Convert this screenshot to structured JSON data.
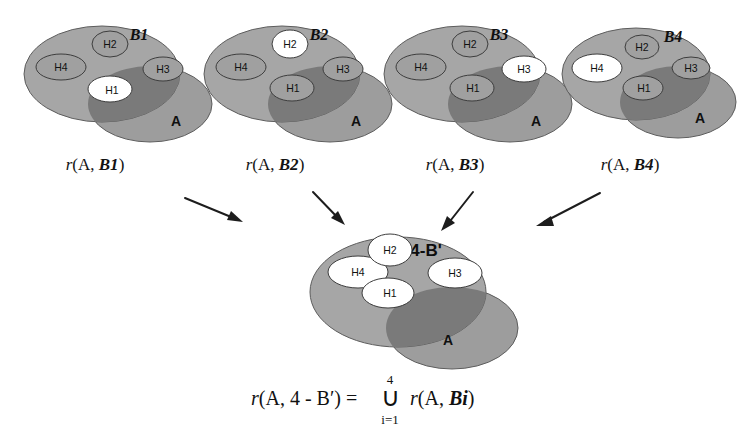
{
  "figure": {
    "colors": {
      "set_b_fill": "#a6a6a6",
      "set_a_fill": "#9d9d9d",
      "intersection_fill": "#7a7a7a",
      "h_fill_inactive": "#a0a0a0",
      "h_fill_active": "#ffffff",
      "outline": "#4a4a4a",
      "text": "#111111",
      "arrow": "#1d1d1d",
      "background": "#ffffff"
    },
    "top_panels": [
      {
        "id": "panel-b1",
        "set_b_label": "B1",
        "set_a_label": "A",
        "caption_prefix": "r",
        "caption": "r(A, B1)",
        "caption_arg_a": "A",
        "caption_arg_b": "B1",
        "highlighted_hypothesis": "H1",
        "hypotheses": [
          {
            "name": "H1",
            "active": true
          },
          {
            "name": "H2",
            "active": false
          },
          {
            "name": "H3",
            "active": false
          },
          {
            "name": "H4",
            "active": false
          }
        ]
      },
      {
        "id": "panel-b2",
        "set_b_label": "B2",
        "set_a_label": "A",
        "caption_prefix": "r",
        "caption": "r(A, B2)",
        "caption_arg_a": "A",
        "caption_arg_b": "B2",
        "highlighted_hypothesis": "H2",
        "hypotheses": [
          {
            "name": "H1",
            "active": false
          },
          {
            "name": "H2",
            "active": true
          },
          {
            "name": "H3",
            "active": false
          },
          {
            "name": "H4",
            "active": false
          }
        ]
      },
      {
        "id": "panel-b3",
        "set_b_label": "B3",
        "set_a_label": "A",
        "caption_prefix": "r",
        "caption": "r(A, B3)",
        "caption_arg_a": "A",
        "caption_arg_b": "B3",
        "highlighted_hypothesis": "H3",
        "hypotheses": [
          {
            "name": "H1",
            "active": false
          },
          {
            "name": "H2",
            "active": false
          },
          {
            "name": "H3",
            "active": true
          },
          {
            "name": "H4",
            "active": false
          }
        ]
      },
      {
        "id": "panel-b4",
        "set_b_label": "B4",
        "set_a_label": "A",
        "caption_prefix": "r",
        "caption": "r(A, B4)",
        "caption_arg_a": "A",
        "caption_arg_b": "B4",
        "highlighted_hypothesis": "H4",
        "hypotheses": [
          {
            "name": "H1",
            "active": false
          },
          {
            "name": "H2",
            "active": false
          },
          {
            "name": "H3",
            "active": false
          },
          {
            "name": "H4",
            "active": true
          }
        ]
      }
    ],
    "bottom_panel": {
      "id": "panel-union",
      "set_b_label": "4-B'",
      "set_a_label": "A",
      "hypotheses": [
        {
          "name": "H1",
          "active": true
        },
        {
          "name": "H2",
          "active": true
        },
        {
          "name": "H3",
          "active": true
        },
        {
          "name": "H4",
          "active": true
        }
      ]
    },
    "arrows": [
      {
        "id": "arrow-from-b1",
        "from_panel": "panel-b1",
        "to_panel": "panel-union",
        "direction": "down-right"
      },
      {
        "id": "arrow-from-b2",
        "from_panel": "panel-b2",
        "to_panel": "panel-union",
        "direction": "down-right"
      },
      {
        "id": "arrow-from-b3",
        "from_panel": "panel-b3",
        "to_panel": "panel-union",
        "direction": "down-left"
      },
      {
        "id": "arrow-from-b4",
        "from_panel": "panel-b4",
        "to_panel": "panel-union",
        "direction": "down-left"
      }
    ],
    "formula": {
      "full": "r(A, 4-B') = ⋃ r(A, Bi)",
      "lhs_r": "r",
      "lhs_args": "(A,  4 - B′) =",
      "union_symbol": "∪",
      "union_upper_limit": "4",
      "union_lower_limit": "i=1",
      "rhs_r": "r",
      "rhs_args": "(A,  Bi)",
      "rhs_arg_a": "A",
      "rhs_arg_b": "Bi"
    }
  }
}
